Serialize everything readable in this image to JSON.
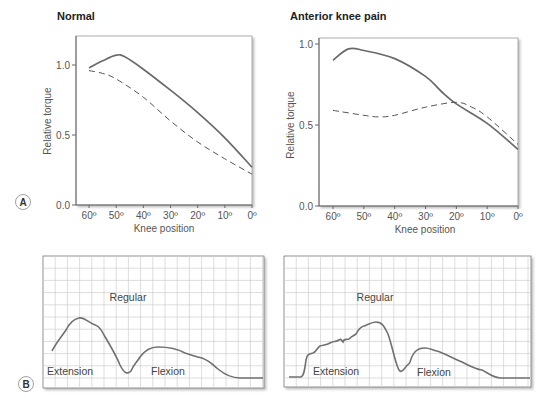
{
  "panel_a_label": "A",
  "panel_b_label": "B",
  "chart_data": [
    {
      "type": "line",
      "title": "Normal",
      "xlabel": "Knee position",
      "ylabel": "Relative torque",
      "x_ticks": [
        "60º",
        "50º",
        "40º",
        "30º",
        "20º",
        "10º",
        "0º"
      ],
      "x": [
        60,
        50,
        40,
        30,
        20,
        10,
        0
      ],
      "y_ticks": [
        "0.0",
        "0.5",
        "1.0"
      ],
      "ylim": [
        0,
        1.2
      ],
      "grid": false,
      "series": [
        {
          "name": "solid",
          "style": "solid",
          "x": [
            60,
            55,
            50,
            47,
            40,
            30,
            20,
            10,
            0
          ],
          "values": [
            0.98,
            1.03,
            1.07,
            1.06,
            0.97,
            0.82,
            0.66,
            0.48,
            0.27
          ]
        },
        {
          "name": "dashed",
          "style": "dashed",
          "x": [
            60,
            55,
            50,
            40,
            30,
            20,
            10,
            0
          ],
          "values": [
            0.96,
            0.94,
            0.9,
            0.77,
            0.6,
            0.45,
            0.33,
            0.22
          ]
        }
      ]
    },
    {
      "type": "line",
      "title": "Anterior knee pain",
      "xlabel": "Knee position",
      "ylabel": "Relative torque",
      "x_ticks": [
        "60º",
        "50º",
        "40º",
        "30º",
        "20º",
        "10º",
        "0º"
      ],
      "x": [
        60,
        50,
        40,
        30,
        20,
        10,
        0
      ],
      "y_ticks": [
        "0.0",
        "0.5",
        "1.0"
      ],
      "ylim": [
        0,
        1.0
      ],
      "grid": false,
      "series": [
        {
          "name": "solid",
          "style": "solid",
          "x": [
            60,
            55,
            50,
            40,
            30,
            25,
            20,
            10,
            0
          ],
          "values": [
            0.9,
            0.97,
            0.96,
            0.91,
            0.8,
            0.71,
            0.63,
            0.51,
            0.35
          ]
        },
        {
          "name": "dashed",
          "style": "dashed",
          "x": [
            60,
            50,
            45,
            40,
            30,
            20,
            15,
            10,
            0
          ],
          "values": [
            0.59,
            0.56,
            0.55,
            0.56,
            0.61,
            0.64,
            0.61,
            0.55,
            0.38
          ]
        }
      ]
    },
    {
      "type": "line",
      "title": "",
      "grid": true,
      "annotations": [
        "Regular",
        "Extension",
        "Flexion"
      ],
      "series": [
        {
          "name": "Normal trace",
          "style": "solid"
        }
      ]
    },
    {
      "type": "line",
      "title": "",
      "grid": true,
      "annotations": [
        "Regular",
        "Extension",
        "Flexion"
      ],
      "series": [
        {
          "name": "Anterior knee pain trace",
          "style": "solid"
        }
      ]
    }
  ]
}
